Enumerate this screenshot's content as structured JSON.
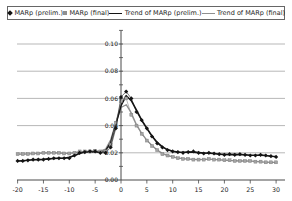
{
  "legend": {
    "items": [
      {
        "label": "MARp (prelim.)",
        "marker": "diamond",
        "color": "#141414"
      },
      {
        "label": "MARp (final)",
        "marker": "square",
        "color": "#8f8f8f"
      },
      {
        "label": "Trend of MARp (prelim.)",
        "marker": "line",
        "color": "#141414"
      },
      {
        "label": "Trend of MARp (final)",
        "marker": "line",
        "color": "#8f8f8f"
      }
    ]
  },
  "chart_data": {
    "type": "line",
    "title": "",
    "xlabel": "",
    "ylabel": "",
    "xlim": [
      -20,
      30
    ],
    "ylim": [
      0,
      0.11
    ],
    "xticks": [
      -20,
      -15,
      -10,
      -5,
      0,
      5,
      10,
      15,
      20,
      25,
      30
    ],
    "yticks": [
      0.0,
      0.02,
      0.04,
      0.06,
      0.08,
      0.1
    ],
    "minor_ytick_step": 0.01,
    "grid": "horizontal",
    "legend_position": "top",
    "axis_color": "#4a4a4a",
    "grid_color": "#9a9a9a",
    "text_color": "#222222",
    "x": [
      -20,
      -19,
      -18,
      -17,
      -16,
      -15,
      -14,
      -13,
      -12,
      -11,
      -10,
      -9,
      -8,
      -7,
      -6,
      -5,
      -4,
      -3,
      -2,
      -1,
      0,
      1,
      2,
      3,
      4,
      5,
      6,
      7,
      8,
      9,
      10,
      11,
      12,
      13,
      14,
      15,
      16,
      17,
      18,
      19,
      20,
      21,
      22,
      23,
      24,
      25,
      26,
      27,
      28,
      29,
      30
    ],
    "series": [
      {
        "name": "MARp (prelim.)",
        "type": "scatter-line",
        "marker": "diamond",
        "color": "#141414",
        "marker_fill": "#141414",
        "values": [
          0.014,
          0.014,
          0.0145,
          0.015,
          0.015,
          0.015,
          0.0155,
          0.016,
          0.016,
          0.016,
          0.016,
          0.018,
          0.02,
          0.0205,
          0.021,
          0.021,
          0.02,
          0.02,
          0.024,
          0.038,
          0.061,
          0.065,
          0.06,
          0.05,
          0.044,
          0.038,
          0.032,
          0.027,
          0.024,
          0.022,
          0.021,
          0.0205,
          0.02,
          0.0205,
          0.021,
          0.02,
          0.0195,
          0.02,
          0.0195,
          0.019,
          0.0185,
          0.019,
          0.0185,
          0.019,
          0.0185,
          0.018,
          0.018,
          0.0185,
          0.018,
          0.0175,
          0.017
        ]
      },
      {
        "name": "MARp (final)",
        "type": "scatter-line",
        "marker": "square",
        "color": "#8f8f8f",
        "marker_fill": "#a3a3a3",
        "values": [
          0.019,
          0.019,
          0.019,
          0.0195,
          0.0195,
          0.02,
          0.02,
          0.02,
          0.02,
          0.0195,
          0.0195,
          0.02,
          0.021,
          0.021,
          0.021,
          0.0215,
          0.021,
          0.021,
          0.026,
          0.042,
          0.058,
          0.06,
          0.048,
          0.04,
          0.034,
          0.029,
          0.025,
          0.022,
          0.019,
          0.018,
          0.017,
          0.016,
          0.0155,
          0.0155,
          0.015,
          0.015,
          0.015,
          0.0155,
          0.015,
          0.015,
          0.0145,
          0.0145,
          0.014,
          0.014,
          0.014,
          0.014,
          0.0135,
          0.0135,
          0.013,
          0.013,
          0.013
        ]
      },
      {
        "name": "Trend of MARp (prelim.)",
        "type": "trend",
        "trend_of": 0,
        "color": "#141414",
        "width": 1.6
      },
      {
        "name": "Trend of MARp (final)",
        "type": "trend",
        "trend_of": 1,
        "color": "#8f8f8f",
        "width": 1.3
      }
    ]
  }
}
